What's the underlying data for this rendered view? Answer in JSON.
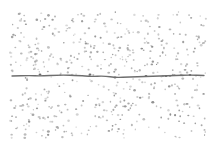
{
  "image": {
    "description": "Speckled light-gray dotted texture on white with a thin dark horizontal wavy line (like a hair or fiber) crossing near the middle",
    "width": 214,
    "height": 142,
    "background": "#ffffff"
  },
  "speckles": {
    "region": {
      "x": 10,
      "y": 12,
      "w": 196,
      "h": 126
    },
    "count": 520,
    "seed": 7,
    "colors": [
      "#b4b4b4",
      "#a6a6a6",
      "#c4c4c4",
      "#9a9a9a",
      "#8e8e8e"
    ],
    "min_size": 0.8,
    "max_size": 1.7
  },
  "fiber": {
    "color": "#6e6e6e",
    "width": 1.3,
    "points": [
      [
        12,
        76
      ],
      [
        30,
        75.5
      ],
      [
        40,
        76
      ],
      [
        60,
        75
      ],
      [
        80,
        75.5
      ],
      [
        90,
        76.5
      ],
      [
        105,
        76
      ],
      [
        115,
        77.5
      ],
      [
        130,
        77
      ],
      [
        145,
        76.5
      ],
      [
        160,
        76
      ],
      [
        175,
        75.5
      ],
      [
        190,
        75
      ],
      [
        204,
        75.5
      ]
    ],
    "knots": [
      [
        40,
        74.5
      ],
      [
        90,
        74.5
      ],
      [
        115,
        77.5
      ],
      [
        146,
        76
      ],
      [
        166,
        76
      ],
      [
        190,
        75
      ]
    ]
  }
}
